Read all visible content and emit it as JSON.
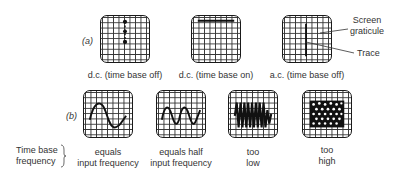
{
  "row_a": {
    "tag": "(a)",
    "screens": [
      {
        "label": "d.c. (time base off)",
        "trace": "vertical-dots"
      },
      {
        "label": "d.c. (time base on)",
        "trace": "horizontal-line"
      },
      {
        "label": "a.c. (time base off)",
        "trace": "vertical-line"
      }
    ],
    "annotations": {
      "graticule": [
        "Screen",
        "graticule"
      ],
      "trace": "Trace"
    }
  },
  "row_b": {
    "tag": "(b)",
    "side_label": [
      "Time base",
      "frequency"
    ],
    "screens": [
      {
        "label": [
          "equals",
          "input frequency"
        ],
        "trace": "sine-1-cycle"
      },
      {
        "label": [
          "equals half",
          "input frequency"
        ],
        "trace": "sine-2-cycles"
      },
      {
        "label": [
          "too",
          "low"
        ],
        "trace": "dense-sine"
      },
      {
        "label": [
          "too",
          "high"
        ],
        "trace": "mesh-blur"
      }
    ]
  },
  "colors": {
    "ink": "#1a1a1a",
    "grid": "#333333",
    "background": "#ffffff"
  }
}
